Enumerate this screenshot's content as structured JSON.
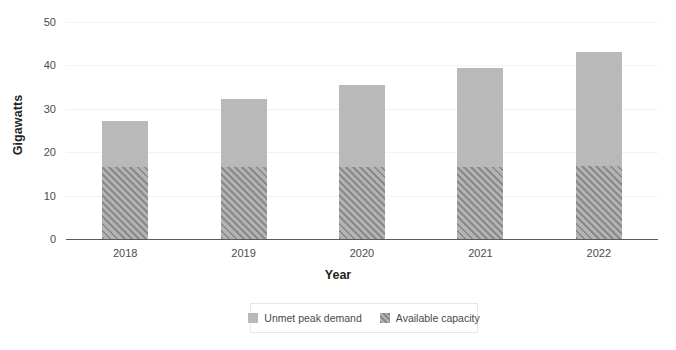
{
  "chart_data": {
    "type": "bar",
    "subtype": "stacked",
    "title": "",
    "xlabel": "Year",
    "ylabel": "Gigawatts",
    "categories": [
      "2018",
      "2019",
      "2020",
      "2021",
      "2022"
    ],
    "series": [
      {
        "name": "Available capacity",
        "pattern": "diagonal-hatch",
        "color": "#9d9d9d",
        "values": [
          16.5,
          16.5,
          16.5,
          16.5,
          16.8
        ]
      },
      {
        "name": "Unmet peak demand",
        "pattern": "solid",
        "color": "#b9b9b9",
        "values": [
          10.7,
          15.8,
          19.1,
          22.9,
          26.4
        ]
      }
    ],
    "totals": [
      27.2,
      32.3,
      35.6,
      39.4,
      43.2
    ],
    "ylim": [
      0,
      50
    ],
    "yticks": [
      0,
      10,
      20,
      30,
      40,
      50
    ],
    "ytick_labels": [
      "0",
      "10",
      "20",
      "30",
      "40",
      "50"
    ],
    "grid": true,
    "grid_axis": "y",
    "legend_position": "bottom",
    "legend_order": [
      "Unmet peak demand",
      "Available capacity"
    ]
  },
  "axes": {
    "y_title": "Gigawatts",
    "x_title": "Year"
  },
  "legend": {
    "items": [
      {
        "label": "Unmet peak demand",
        "swatch": "solid-gray-swatch-icon"
      },
      {
        "label": "Available capacity",
        "swatch": "hatched-gray-swatch-icon"
      }
    ]
  },
  "colors": {
    "unmet_peak_demand": "#b9b9b9",
    "available_capacity": "#9d9d9d",
    "hatch_stroke": "#8a8a8a",
    "gridline": "#f2f2f2",
    "axis": "#5b5b5b",
    "text": "#4c4c4c",
    "title_text": "#231f20",
    "legend_border": "#e8e8e8",
    "background": "#ffffff"
  }
}
